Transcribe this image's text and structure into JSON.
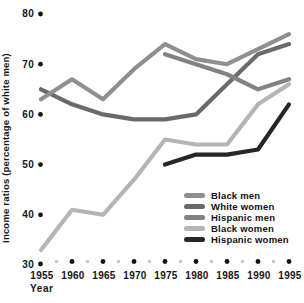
{
  "chart_data": {
    "type": "line",
    "title": "",
    "xlabel": "Year",
    "ylabel": "Income ratios (percentage of white men)",
    "x": [
      1955,
      1960,
      1965,
      1970,
      1975,
      1980,
      1985,
      1990,
      1995
    ],
    "xlim": [
      1955,
      1995
    ],
    "ylim": [
      30,
      80
    ],
    "yticks": [
      30,
      40,
      50,
      60,
      70,
      80
    ],
    "grid": false,
    "legend_position": "inside-right-middle",
    "axis_style": "dot ticks (black at labeled values, light gray minor dots between years), no axis lines",
    "series": [
      {
        "name": "Black men",
        "color": "#8f8f8f",
        "values": [
          63,
          67,
          63,
          69,
          74,
          71,
          70,
          73,
          76
        ]
      },
      {
        "name": "White women",
        "color": "#6a6a6a",
        "values": [
          65,
          62,
          60,
          59,
          59,
          60,
          66,
          72,
          74
        ]
      },
      {
        "name": "Hispanic men",
        "color": "#828282",
        "values": [
          null,
          null,
          null,
          null,
          72,
          70,
          68,
          65,
          67
        ]
      },
      {
        "name": "Black women",
        "color": "#b5b5b5",
        "values": [
          33,
          41,
          40,
          47,
          55,
          54,
          54,
          62,
          66
        ]
      },
      {
        "name": "Hispanic women",
        "color": "#262626",
        "values": [
          null,
          null,
          null,
          null,
          50,
          52,
          52,
          53,
          62
        ]
      }
    ],
    "colors": {
      "text": "#161616",
      "major_tick_dot": "#111111",
      "minor_tick_dot": "#c6c6c6",
      "background": "#ffffff"
    }
  }
}
